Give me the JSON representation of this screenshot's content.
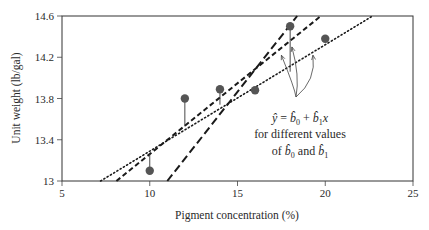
{
  "chart_data": {
    "type": "scatter",
    "title": "",
    "xlabel": "Pigment concentration (%)",
    "ylabel": "Unit weight (lb/gal)",
    "xlim": [
      5,
      25
    ],
    "ylim": [
      13,
      14.6
    ],
    "xticks": [
      5,
      10,
      15,
      20,
      25
    ],
    "xtick_labels": [
      "5",
      "10",
      "15",
      "20",
      "25"
    ],
    "yticks": [
      13,
      13.4,
      13.8,
      14.2,
      14.6
    ],
    "ytick_labels": [
      "13",
      "13.4",
      "13.8",
      "14.2",
      "14.6"
    ],
    "grid": false,
    "legend": "none",
    "points": {
      "x": [
        10,
        12,
        14,
        16,
        18,
        20
      ],
      "y": [
        13.1,
        13.8,
        13.89,
        13.88,
        14.5,
        14.38
      ]
    },
    "lines": [
      {
        "name": "line-dotted",
        "style": "dotted",
        "x": [
          7.2,
          22.7
        ],
        "y": [
          13,
          14.6
        ]
      },
      {
        "name": "line-dashed",
        "style": "dashed",
        "x": [
          8.1,
          19.75
        ],
        "y": [
          13,
          14.6
        ]
      },
      {
        "name": "line-long-dashed",
        "style": "long-dashed",
        "x": [
          11.0,
          18.4
        ],
        "y": [
          13,
          14.6
        ]
      }
    ],
    "residual_segments": [
      {
        "x": 10,
        "y_from": 13.1,
        "y_to": 13.26
      },
      {
        "x": 12,
        "y_from": 13.8,
        "y_to": 13.53
      },
      {
        "x": 14,
        "y_from": 13.89,
        "y_to": 13.74
      },
      {
        "x": 18,
        "y_from": 14.5,
        "y_to": 14.06
      }
    ],
    "annotation": {
      "line1": "ŷ = b̂₀ + b̂₁x",
      "line2": "for different values",
      "line3": "of b̂₀ and b̂₁",
      "arrow_targets": [
        {
          "x": 17.5,
          "y": 14.22
        },
        {
          "x": 18.1,
          "y": 14.3
        },
        {
          "x": 19.3,
          "y": 14.22
        }
      ]
    },
    "colors": {
      "points": "#555555",
      "lines": "#1a1a1a",
      "frame": "#333333"
    }
  }
}
